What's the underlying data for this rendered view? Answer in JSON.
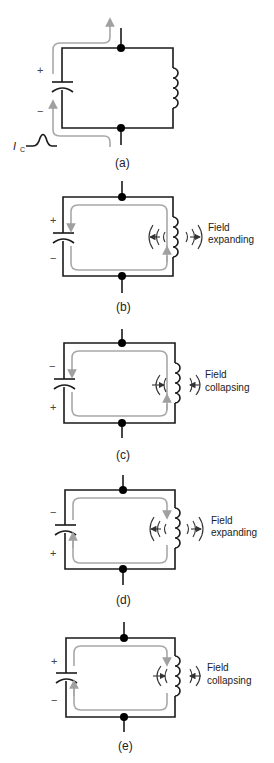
{
  "figure": {
    "panels": [
      {
        "id": "a",
        "label": "(a)",
        "cap_top_sign": "+",
        "cap_bottom_sign": "−",
        "field_text_1": "",
        "field_text_2": "",
        "current_label": "I",
        "current_sub": "C"
      },
      {
        "id": "b",
        "label": "(b)",
        "cap_top_sign": "+",
        "cap_bottom_sign": "−",
        "field_text_1": "Field",
        "field_text_2": "expanding"
      },
      {
        "id": "c",
        "label": "(c)",
        "cap_top_sign": "−",
        "cap_bottom_sign": "+",
        "field_text_1": "Field",
        "field_text_2": "collapsing"
      },
      {
        "id": "d",
        "label": "(d)",
        "cap_top_sign": "−",
        "cap_bottom_sign": "+",
        "field_text_1": "Field",
        "field_text_2": "expanding"
      },
      {
        "id": "e",
        "label": "(e)",
        "cap_top_sign": "+",
        "cap_bottom_sign": "−",
        "field_text_1": "Field",
        "field_text_2": "collapsing"
      }
    ],
    "colors": {
      "wire": "#1a1a1a",
      "current_flow": "#a8a8a8"
    }
  }
}
